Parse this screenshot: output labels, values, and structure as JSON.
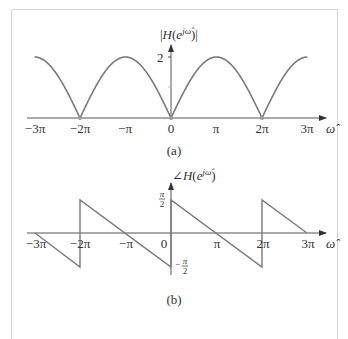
{
  "figure": {
    "panels": [
      {
        "id": "a",
        "caption": "(a)",
        "ylabel": "|H(e^{jω̂})|",
        "xlabel": "ω̂",
        "xticks": [
          "−3π",
          "−2π",
          "−π",
          "0",
          "π",
          "2π",
          "3π"
        ],
        "yticks": [
          "2"
        ]
      },
      {
        "id": "b",
        "caption": "(b)",
        "ylabel": "∠H(e^{jω̂})",
        "xlabel": "ω̂",
        "xticks": [
          "−3π",
          "−2π",
          "−π",
          "0",
          "π",
          "2π",
          "3π"
        ],
        "yticks": [
          "π/2",
          "−π/2"
        ]
      }
    ],
    "colors": {
      "curve": "#7a7a7a",
      "axis": "#444444",
      "frame": "#d6d6d6"
    }
  },
  "chart_data": [
    {
      "type": "line",
      "title": "(a)",
      "xlabel": "ω̂",
      "ylabel": "|H(e^{jω̂})|",
      "x": [
        "-3π",
        "-2.5π",
        "-2π",
        "-1.5π",
        "-π",
        "-0.5π",
        "0",
        "0.5π",
        "π",
        "1.5π",
        "2π",
        "2.5π",
        "3π"
      ],
      "values": [
        2,
        1.414,
        0,
        1.414,
        2,
        1.414,
        0,
        1.414,
        2,
        1.414,
        0,
        1.414,
        2
      ],
      "xlim": [
        "-3π",
        "3π"
      ],
      "ylim": [
        0,
        2
      ],
      "yticks": [
        2
      ],
      "grid": false,
      "legend": null
    },
    {
      "type": "line",
      "title": "(b)",
      "xlabel": "ω̂",
      "ylabel": "∠H(e^{jω̂})",
      "x": [
        "-3π",
        "-2π⁻",
        "-2π⁺",
        "-π",
        "0⁻",
        "0⁺",
        "π",
        "2π⁻",
        "2π⁺",
        "3π"
      ],
      "values": [
        "0",
        "-π/2",
        "π/2",
        "0",
        "-π/2",
        "π/2",
        "0",
        "-π/2",
        "π/2",
        "0"
      ],
      "xlim": [
        "-3π",
        "3π"
      ],
      "ylim": [
        "-π/2",
        "π/2"
      ],
      "yticks": [
        "π/2",
        "-π/2"
      ],
      "grid": false,
      "legend": null
    }
  ]
}
